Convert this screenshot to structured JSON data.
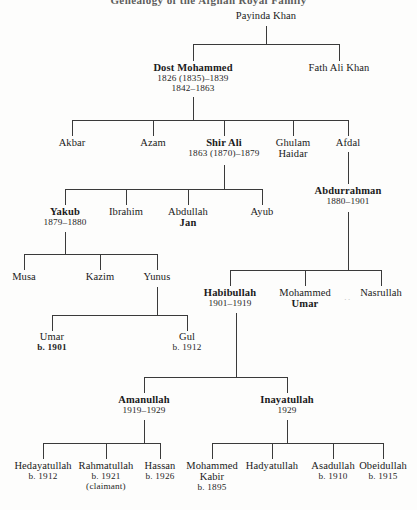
{
  "title": "Genealogy of the Afghan Royal Family",
  "people": {
    "payinda": {
      "name": "Payinda Khan",
      "dates": ""
    },
    "dost": {
      "name": "Dost Mohammed",
      "dates": "1826 (1835)–1839",
      "dates2": "1842–1863"
    },
    "fath": {
      "name": "Fath Ali Khan",
      "dates": ""
    },
    "akbar": {
      "name": "Akbar",
      "dates": ""
    },
    "azam": {
      "name": "Azam",
      "dates": ""
    },
    "shirali": {
      "name": "Shir Ali",
      "dates": "1863 (1870)–1879"
    },
    "ghulam": {
      "name": "Ghulam",
      "name2": "Haidar",
      "dates": ""
    },
    "afdal": {
      "name": "Afdal",
      "dates": ""
    },
    "abdurrahman": {
      "name": "Abdurrahman",
      "dates": "1880–1901"
    },
    "yakub": {
      "name": "Yakub",
      "dates": "1879–1880"
    },
    "ibrahim": {
      "name": "Ibrahim",
      "dates": ""
    },
    "abdullahjan": {
      "name": "Abdullah",
      "name2": "Jan",
      "dates": ""
    },
    "ayub": {
      "name": "Ayub",
      "dates": ""
    },
    "musa": {
      "name": "Musa",
      "dates": ""
    },
    "kazim": {
      "name": "Kazim",
      "dates": ""
    },
    "yunus": {
      "name": "Yunus",
      "dates": ""
    },
    "umar": {
      "name": "Umar",
      "dates": "b. 1901"
    },
    "gul": {
      "name": "Gul",
      "dates": "b. 1912"
    },
    "habibullah": {
      "name": "Habibullah",
      "dates": "1901–1919"
    },
    "mohammedumar": {
      "name": "Mohammed",
      "name2": "Umar",
      "dates": ""
    },
    "nasrullah": {
      "name": "Nasrullah",
      "dates": ""
    },
    "amanullah": {
      "name": "Amanullah",
      "dates": "1919–1929"
    },
    "inayatullah": {
      "name": "Inayatullah",
      "dates": "1929"
    },
    "hedayatullah": {
      "name": "Hedayatullah",
      "dates": "b. 1912"
    },
    "rahmatullah": {
      "name": "Rahmatullah",
      "dates": "b. 1921",
      "dates2": "(claimant)"
    },
    "hassan": {
      "name": "Hassan",
      "dates": "b. 1926"
    },
    "mohammedkabir": {
      "name": "Mohammed",
      "name2": "Kabir",
      "dates": "b. 1895"
    },
    "hadyatullah": {
      "name": "Hadyatullah",
      "dates": ""
    },
    "asadullah": {
      "name": "Asadullah",
      "dates": "b. 1910"
    },
    "obeidullah": {
      "name": "Obeidullah",
      "dates": "b. 1915"
    }
  },
  "marks": {
    "ellipsis": "․․"
  },
  "colors": {
    "ink": "#1a1a1a",
    "line": "#3a3a3a",
    "paper": "#fdfdfc"
  }
}
